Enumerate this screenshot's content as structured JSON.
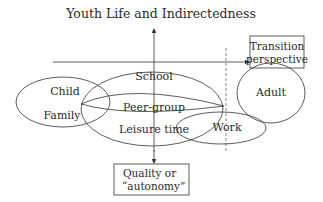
{
  "title": "Youth Life and Indirectedness",
  "boxes": {
    "transition": {
      "line1": "Transition",
      "line2": "perspective"
    },
    "quality": {
      "line1": "Quality or",
      "line2": "“autonomy”"
    }
  },
  "ellipses": {
    "child": {
      "label_top": "Child",
      "label_bottom": "Family"
    },
    "school": {
      "label": "School"
    },
    "peer_group": {
      "label": "Peer-group"
    },
    "leisure": {
      "label": "Leisure time"
    },
    "work": {
      "label": "Work"
    },
    "adult": {
      "label": "Adult"
    }
  },
  "colors": {
    "stroke": "#333333",
    "text": "#2a2a2a",
    "background": "#ffffff"
  }
}
